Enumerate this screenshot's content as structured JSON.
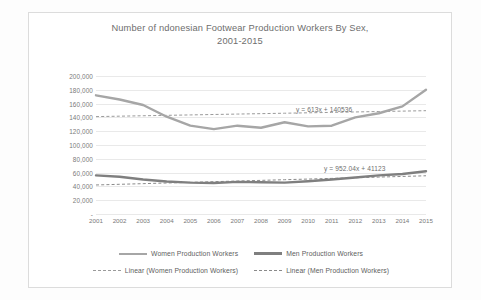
{
  "chart_data": {
    "type": "line",
    "title_line1": "Number of  ndonesian Footwear Production Workers By Sex,",
    "title_line2": "2001-2015",
    "xlabel": "",
    "ylabel": "",
    "categories": [
      "2001",
      "2002",
      "2003",
      "2004",
      "2005",
      "2006",
      "2007",
      "2008",
      "2009",
      "2010",
      "2011",
      "2012",
      "2013",
      "2014",
      "2015"
    ],
    "ylim": [
      0,
      200000
    ],
    "ytick_labels": [
      "200,000",
      "180,000",
      "160,000",
      "140,000",
      "120,000",
      "100,000",
      "80,000",
      "60,000",
      "40,000",
      "20,000",
      "-"
    ],
    "ytick_values": [
      200000,
      180000,
      160000,
      140000,
      120000,
      100000,
      80000,
      60000,
      40000,
      20000,
      0
    ],
    "grid": true,
    "legend_position": "bottom",
    "series": [
      {
        "name": "Women Production Workers",
        "style": "solid",
        "color": "#a6a6a6",
        "values": [
          172000,
          166000,
          158000,
          141000,
          128000,
          123000,
          128000,
          125000,
          133000,
          127000,
          128000,
          140000,
          146000,
          156000,
          180000
        ]
      },
      {
        "name": "Men Production Workers",
        "style": "solid",
        "color": "#7f7f7f",
        "values": [
          56000,
          54000,
          50000,
          47000,
          45500,
          45000,
          46500,
          46000,
          45500,
          47500,
          50000,
          53000,
          56000,
          58000,
          62000
        ]
      },
      {
        "name": "Linear (Women Production Workers)",
        "style": "dashed",
        "color": "#9a9a9a",
        "equation": "y = 613x + 140536",
        "slope": 613,
        "intercept": 140536,
        "values": [
          141149,
          141762,
          142375,
          142988,
          143601,
          144214,
          144827,
          145440,
          146053,
          146666,
          147279,
          147892,
          148505,
          149118,
          149731
        ]
      },
      {
        "name": "Linear (Men Production Workers)",
        "style": "dashed",
        "color": "#8a8a8a",
        "equation": "y = 952.04x + 41123",
        "slope": 952.04,
        "intercept": 41123,
        "values": [
          42075,
          43027,
          43979,
          44931,
          45883,
          46835,
          47788,
          48740,
          49692,
          50644,
          51596,
          52548,
          53500,
          54452,
          55404
        ]
      }
    ],
    "annotations": [
      {
        "text": "y = 613x + 140536",
        "series": "Linear (Women Production Workers)"
      },
      {
        "text": "y = 952.04x + 41123",
        "series": "Linear (Men Production Workers)"
      }
    ]
  },
  "legend": {
    "items": [
      {
        "label": "Women Production Workers",
        "marker": "solid-line",
        "color": "#a6a6a6"
      },
      {
        "label": "Men Production Workers",
        "marker": "solid-line-thick",
        "color": "#7f7f7f"
      },
      {
        "label": "Linear (Women Production Workers)",
        "marker": "dashed-line",
        "color": "#9a9a9a"
      },
      {
        "label": "Linear (Men Production Workers)",
        "marker": "dashed-line",
        "color": "#8a8a8a"
      }
    ]
  }
}
